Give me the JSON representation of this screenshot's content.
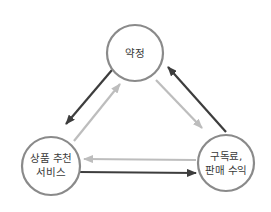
{
  "diagram": {
    "nodes": [
      {
        "id": "pledge",
        "label_lines": [
          "약정"
        ],
        "cx": 135,
        "cy": 53,
        "r": 28
      },
      {
        "id": "recommend",
        "label_lines": [
          "상품 추천",
          "서비스"
        ],
        "cx": 51,
        "cy": 166,
        "r": 29
      },
      {
        "id": "revenue",
        "label_lines": [
          "구독료,",
          "판매 수익"
        ],
        "cx": 226,
        "cy": 163,
        "r": 28
      }
    ],
    "edges": [
      {
        "from": "pledge",
        "to": "recommend",
        "style": "dark"
      },
      {
        "from": "recommend",
        "to": "pledge",
        "style": "light"
      },
      {
        "from": "pledge",
        "to": "revenue",
        "style": "light"
      },
      {
        "from": "revenue",
        "to": "pledge",
        "style": "dark"
      },
      {
        "from": "revenue",
        "to": "recommend",
        "style": "light"
      },
      {
        "from": "recommend",
        "to": "revenue",
        "style": "dark"
      }
    ],
    "colors": {
      "node_stroke": "#8a8a8a",
      "node_fill": "#ffffff",
      "arrow_dark": "#3d3d3d",
      "arrow_light": "#bdbdbd",
      "text": "#3a3a3a"
    }
  }
}
